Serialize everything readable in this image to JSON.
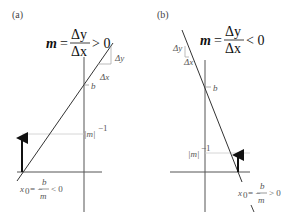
{
  "panels": [
    {
      "id": "a",
      "label": "(a)",
      "formula": {
        "lhs": "m",
        "eq": "=",
        "numerator": "Δy",
        "denominator": "Δx",
        "relation": "> 0"
      },
      "delta_y": "Δy",
      "delta_x": "Δx",
      "intercept_label": "b",
      "inverse_slope_label": "|m|",
      "inverse_slope_exp": "−1",
      "root_label": {
        "var": "x",
        "sub": "0",
        "eq": "= −",
        "numerator": "b",
        "denominator": "m",
        "relation": "< 0"
      }
    },
    {
      "id": "b",
      "label": "(b)",
      "formula": {
        "lhs": "m",
        "eq": "=",
        "numerator": "Δy",
        "denominator": "Δx",
        "relation": "< 0"
      },
      "delta_y": "Δy",
      "delta_x": "Δx",
      "intercept_label": "b",
      "inverse_slope_label": "|m|",
      "inverse_slope_exp": "−1",
      "root_label": {
        "var": "x",
        "sub": "0",
        "eq": "= −",
        "numerator": "b",
        "denominator": "m",
        "relation": "> 0"
      }
    }
  ],
  "colors": {
    "line": "#333333",
    "axis": "#555555",
    "guide": "#cccccc",
    "arrow": "#111111"
  }
}
